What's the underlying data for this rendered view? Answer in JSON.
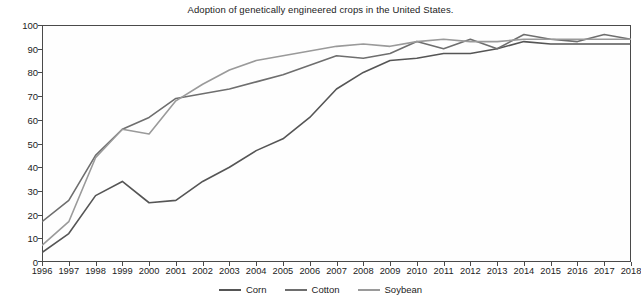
{
  "chart_data": {
    "type": "line",
    "title": "Adoption of genetically engineered crops in the United States.",
    "xlabel": "",
    "ylabel": "",
    "xlim": [
      1996,
      2018
    ],
    "ylim": [
      0,
      100
    ],
    "grid": false,
    "legend_position": "bottom-center",
    "categories": [
      1996,
      1997,
      1998,
      1999,
      2000,
      2001,
      2002,
      2003,
      2004,
      2005,
      2006,
      2007,
      2008,
      2009,
      2010,
      2011,
      2012,
      2013,
      2014,
      2015,
      2016,
      2017,
      2018
    ],
    "x_tick_labels": [
      "1996",
      "1997",
      "1998",
      "1999",
      "2000",
      "2001",
      "2002",
      "2003",
      "2004",
      "2005",
      "2006",
      "2007",
      "2008",
      "2009",
      "2010",
      "2011",
      "2012",
      "2013",
      "2014",
      "2015",
      "2016",
      "2017",
      "2018"
    ],
    "y_tick_labels": [
      "0",
      "10",
      "20",
      "30",
      "40",
      "50",
      "60",
      "70",
      "80",
      "90",
      "100"
    ],
    "y_ticks": [
      0,
      10,
      20,
      30,
      40,
      50,
      60,
      70,
      80,
      90,
      100
    ],
    "series": [
      {
        "name": "Corn",
        "color": "#555555",
        "values": [
          4,
          12,
          28,
          34,
          25,
          26,
          34,
          40,
          47,
          52,
          61,
          73,
          80,
          85,
          86,
          88,
          88,
          90,
          93,
          92,
          92,
          92,
          92
        ]
      },
      {
        "name": "Cotton",
        "color": "#6e6e6e",
        "values": [
          17,
          26,
          45,
          56,
          61,
          69,
          71,
          73,
          76,
          79,
          83,
          87,
          86,
          88,
          93,
          90,
          94,
          90,
          96,
          94,
          93,
          96,
          94
        ]
      },
      {
        "name": "Soybean",
        "color": "#9a9a9a",
        "values": [
          7,
          17,
          44,
          56,
          54,
          68,
          75,
          81,
          85,
          87,
          89,
          91,
          92,
          91,
          93,
          94,
          93,
          93,
          94,
          94,
          94,
          94,
          94
        ]
      }
    ]
  },
  "legend": {
    "entries": [
      {
        "label": "Corn"
      },
      {
        "label": "Cotton"
      },
      {
        "label": "Soybean"
      }
    ]
  }
}
